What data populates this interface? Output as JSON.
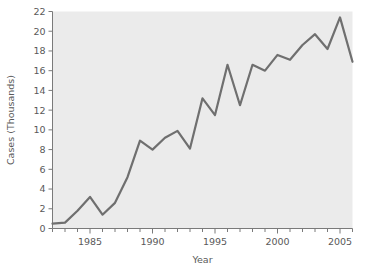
{
  "chart_data": {
    "type": "line",
    "title": "",
    "subtitle": "",
    "xlabel": "Year",
    "ylabel": "Cases (Thousands)",
    "xlim": [
      1982,
      2006
    ],
    "ylim": [
      0,
      22
    ],
    "grid": false,
    "legend": null,
    "legend_position": "none",
    "plot_background_color": "#ebebeb",
    "figure_background_color": "#ffffff",
    "line_color": "#6f6f6f",
    "line_width": 2.2,
    "axis_color": "#7a7a7a",
    "text_color": "#595959",
    "x_major_ticks": [
      1985,
      1990,
      1995,
      2000,
      2005
    ],
    "x_major_tick_labels": [
      "1985",
      "1990",
      "1995",
      "2000",
      "2005"
    ],
    "x_minor_tick_step": 1,
    "y_ticks": [
      0,
      2,
      4,
      6,
      8,
      10,
      12,
      14,
      16,
      18,
      20,
      22
    ],
    "y_tick_labels": [
      "0",
      "2",
      "4",
      "6",
      "8",
      "10",
      "12",
      "14",
      "16",
      "18",
      "20",
      "22"
    ],
    "x": [
      1982,
      1983,
      1984,
      1985,
      1986,
      1987,
      1988,
      1989,
      1990,
      1991,
      1992,
      1993,
      1994,
      1995,
      1996,
      1997,
      1998,
      1999,
      2000,
      2001,
      2002,
      2003,
      2004,
      2005,
      2006
    ],
    "values": [
      0.5,
      0.6,
      1.8,
      3.2,
      1.4,
      2.6,
      5.2,
      8.9,
      8.0,
      9.2,
      9.9,
      8.1,
      13.2,
      11.5,
      16.6,
      12.5,
      16.6,
      16.0,
      17.6,
      17.1,
      18.6,
      19.7,
      18.2,
      21.4,
      16.9
    ],
    "series": [
      {
        "name": "Cases",
        "values": [
          0.5,
          0.6,
          1.8,
          3.2,
          1.4,
          2.6,
          5.2,
          8.9,
          8.0,
          9.2,
          9.9,
          8.1,
          13.2,
          11.5,
          16.6,
          12.5,
          16.6,
          16.0,
          17.6,
          17.1,
          18.6,
          19.7,
          18.2,
          21.4,
          16.9
        ]
      }
    ]
  }
}
